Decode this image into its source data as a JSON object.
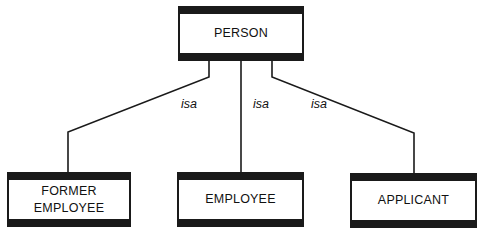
{
  "diagram": {
    "type": "isa-hierarchy",
    "parent": {
      "label": "PERSON"
    },
    "children": [
      {
        "label": "FORMER\nEMPLOYEE",
        "relation": "isa"
      },
      {
        "label": "EMPLOYEE",
        "relation": "isa"
      },
      {
        "label": "APPLICANT",
        "relation": "isa"
      }
    ],
    "colors": {
      "stroke": "#1a1a1a",
      "fill": "#ffffff",
      "text": "#111111"
    }
  }
}
